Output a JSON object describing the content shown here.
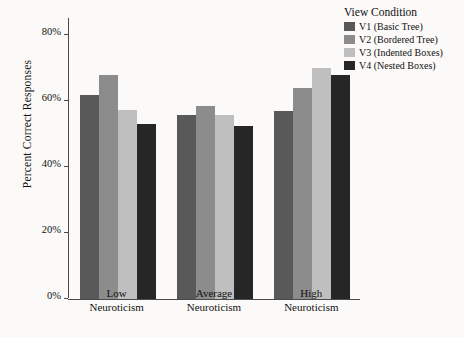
{
  "chart_data": {
    "type": "bar",
    "title": "",
    "subtitle": "",
    "xlabel": "",
    "ylabel": "Percent Correct Responses",
    "categories": [
      "Low Neuroticism",
      "Average Neuroticism",
      "High Neuroticism"
    ],
    "category_lines": [
      [
        "Low",
        "Neuroticism"
      ],
      [
        "Average",
        "Neuroticism"
      ],
      [
        "High",
        "Neuroticism"
      ]
    ],
    "ylim": [
      0,
      85
    ],
    "ytick_values": [
      0,
      20,
      40,
      60,
      80
    ],
    "ytick_labels": [
      "0%",
      "20%",
      "40%",
      "60%",
      "80%"
    ],
    "grid": false,
    "legend_position": "right",
    "legend_title": "View Condition",
    "series": [
      {
        "name": "V1 (Basic Tree)",
        "short": "V1",
        "color": "#595959",
        "values": [
          62,
          56,
          57
        ]
      },
      {
        "name": "V2 (Bordered Tree)",
        "short": "V2",
        "color": "#8c8c8c",
        "values": [
          68,
          58.5,
          64
        ]
      },
      {
        "name": "V3 (Indented Boxes)",
        "short": "V3",
        "color": "#bfbfbf",
        "values": [
          57.5,
          56,
          70
        ]
      },
      {
        "name": "V4 (Nested Boxes)",
        "short": "V4",
        "color": "#262626",
        "values": [
          53,
          52.5,
          68
        ]
      }
    ]
  },
  "colors": {
    "background": "#fbfaf8",
    "axis": "#4a4a4a",
    "text": "#111111"
  }
}
